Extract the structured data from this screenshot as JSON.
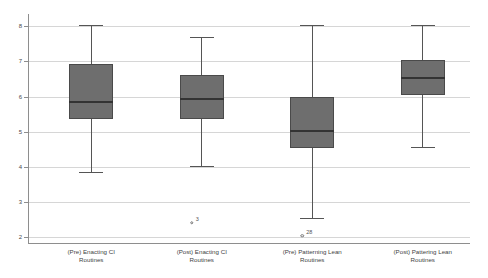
{
  "chart_data": {
    "type": "box",
    "title": "",
    "xlabel": "",
    "ylabel": "",
    "ylim": [
      1.8,
      8.35
    ],
    "grid": true,
    "legend": "none",
    "yticks": [
      "2",
      "3",
      "4",
      "5",
      "6",
      "7",
      "8"
    ],
    "ytick_values": [
      2,
      3,
      4,
      5,
      6,
      7,
      8
    ],
    "categories": [
      "(Pre) Enacting CI Routines",
      "(Post) Enacting CI Routines",
      "(Pre) Patterning Lean Routines",
      "(Post) Patterning Lean Routines"
    ],
    "boxes": [
      {
        "category": "(Pre) Enacting CI Routines",
        "label_line1": "(Pre) Enacting CI",
        "label_line2": "Routines",
        "whisker_low": 3.85,
        "q1": 5.35,
        "median": 5.85,
        "q3": 6.93,
        "whisker_high": 8.05,
        "outliers": []
      },
      {
        "category": "(Post) Enacting CI Routines",
        "label_line1": "(Post) Enacting CI",
        "label_line2": "Routines",
        "whisker_low": 4.02,
        "q1": 5.37,
        "median": 5.93,
        "q3": 6.6,
        "whisker_high": 7.7,
        "outliers": [
          {
            "value": 2.4,
            "label": "3"
          }
        ]
      },
      {
        "category": "(Pre) Patterning Lean Routines",
        "label_line1": "(Pre) Patterning Lean",
        "label_line2": "Routines",
        "whisker_low": 2.53,
        "q1": 4.53,
        "median": 5.03,
        "q3": 6.0,
        "whisker_high": 8.05,
        "outliers": [
          {
            "value": 2.03,
            "label": "28"
          }
        ]
      },
      {
        "category": "(Post) Patterning Lean Routines",
        "label_line1": "(Post) Pattering Lean",
        "label_line2": "Routines",
        "whisker_low": 4.55,
        "q1": 6.05,
        "median": 6.53,
        "q3": 7.05,
        "whisker_high": 8.05,
        "outliers": []
      }
    ],
    "colors": {
      "box_fill": "#6e6e6e",
      "box_border": "#4a4a4a",
      "median": "#333333",
      "whisker": "#555555",
      "gridline": "#d6d6d6",
      "axis": "#8e8e8e",
      "background": "#ffffff",
      "text": "#3f3f3f"
    }
  }
}
